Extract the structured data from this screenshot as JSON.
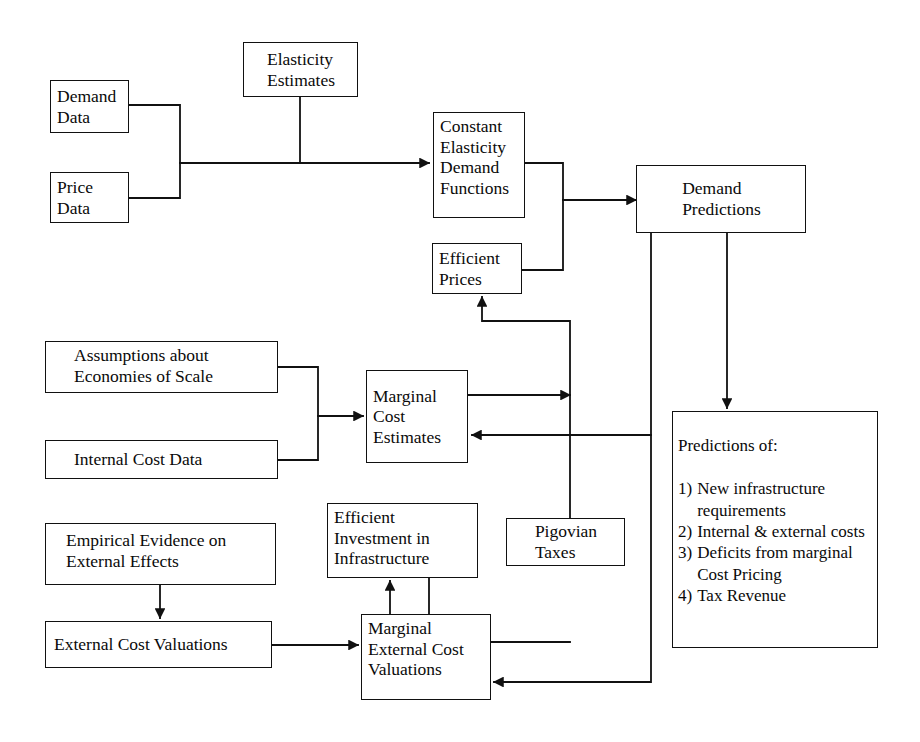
{
  "diagram": {
    "line_color": "#111111",
    "box_fill": "#ffffff",
    "text_color": "#0a0a0a"
  },
  "nodes": {
    "demand_data": "Demand\nData",
    "price_data": "Price\nData",
    "elasticity_estimates": "Elasticity\nEstimates",
    "constant_elasticity_demand_functions": "Constant\nElasticity\nDemand\nFunctions",
    "efficient_prices": "Efficient\nPrices",
    "demand_predictions": "Demand\nPredictions",
    "assumptions_economies_of_scale": "Assumptions about\nEconomies of Scale",
    "internal_cost_data": "Internal Cost Data",
    "marginal_cost_estimates": "Marginal\nCost\nEstimates",
    "empirical_evidence_external_effects": "Empirical Evidence on\nExternal Effects",
    "external_cost_valuations": "External Cost Valuations",
    "efficient_investment_infrastructure": "Efficient\nInvestment in\nInfrastructure",
    "pigovian_taxes": "Pigovian\nTaxes",
    "marginal_external_cost_valuations": "Marginal\nExternal Cost\nValuations"
  },
  "predictions": {
    "heading": "Predictions of:",
    "items": [
      {
        "num": "1)",
        "text": "New infrastructure requirements"
      },
      {
        "num": "2)",
        "text": "Internal & external costs"
      },
      {
        "num": "3)",
        "text": "Deficits from marginal Cost Pricing"
      },
      {
        "num": "4)",
        "text": "Tax Revenue"
      }
    ]
  },
  "edges": [
    {
      "from": "demand_data",
      "to": "constant_elasticity_demand_functions",
      "arrow": true
    },
    {
      "from": "price_data",
      "to": "constant_elasticity_demand_functions",
      "arrow": true
    },
    {
      "from": "elasticity_estimates",
      "to": "constant_elasticity_demand_functions",
      "arrow": false
    },
    {
      "from": "constant_elasticity_demand_functions",
      "to": "demand_predictions",
      "arrow": true
    },
    {
      "from": "efficient_prices",
      "to": "demand_predictions",
      "arrow": true
    },
    {
      "from": "demand_predictions",
      "to": "predictions_of",
      "arrow": true
    },
    {
      "from": "demand_predictions",
      "to": "marginal_cost_estimates",
      "arrow": true
    },
    {
      "from": "assumptions_economies_of_scale",
      "to": "marginal_cost_estimates",
      "arrow": true
    },
    {
      "from": "internal_cost_data",
      "to": "marginal_cost_estimates",
      "arrow": true
    },
    {
      "from": "marginal_cost_estimates",
      "to": "efficient_prices",
      "arrow": true
    },
    {
      "from": "empirical_evidence_external_effects",
      "to": "external_cost_valuations",
      "arrow": true
    },
    {
      "from": "external_cost_valuations",
      "to": "marginal_external_cost_valuations",
      "arrow": true
    },
    {
      "from": "marginal_external_cost_valuations",
      "to": "efficient_investment_infrastructure",
      "arrow": true
    },
    {
      "from": "efficient_investment_infrastructure",
      "to": "marginal_external_cost_valuations",
      "arrow": false
    },
    {
      "from": "marginal_external_cost_valuations",
      "to": "pigovian_taxes",
      "arrow": true
    },
    {
      "from": "pigovian_taxes",
      "to": "efficient_prices",
      "arrow": true
    },
    {
      "from": "predictions_of",
      "to": "marginal_external_cost_valuations",
      "arrow": true
    }
  ]
}
